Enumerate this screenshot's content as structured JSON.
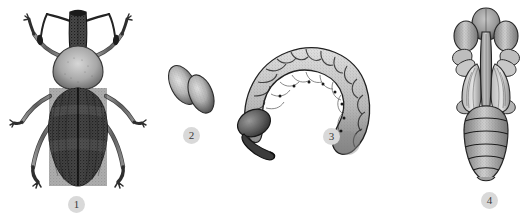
{
  "plate": {
    "title": "Weevil life cycle plate",
    "description": "Scientific stipple-engraving illustration of the four developmental stages of a weevil",
    "width": 527,
    "height": 216,
    "background_color": "#ffffff",
    "style": "stippled pen-and-ink scientific illustration, grayscale"
  },
  "label_style": {
    "circle_fill": "#d9d9d9",
    "text_color": "#3a3a3a",
    "diameter_px": 17
  },
  "figures": [
    {
      "number": "1",
      "name": "adult-weevil",
      "common_name": "Adult weevil",
      "stage": "adult",
      "orientation": "dorsal view",
      "position": {
        "x": 8,
        "y": 4,
        "width": 140,
        "height": 190
      },
      "label_position": {
        "x": 68,
        "y": 196
      },
      "tone": "dark",
      "features": [
        "elongate rostrum (snout)",
        "elbowed clubbed antennae",
        "globular pronotum",
        "dark striate elytra with median suture",
        "three pairs of long legs with clawed tarsi"
      ]
    },
    {
      "number": "2",
      "name": "weevil-eggs",
      "common_name": "Eggs",
      "stage": "egg",
      "orientation": "pair, overlapping obliquely",
      "position": {
        "x": 163,
        "y": 57,
        "width": 60,
        "height": 62
      },
      "label_position": {
        "x": 183,
        "y": 127
      },
      "tone": "medium",
      "count": 2,
      "features": [
        "two elongate-oval eggs",
        "smooth chorion with stippled highlight",
        "darker shaded margins"
      ]
    },
    {
      "number": "3",
      "name": "weevil-larva",
      "common_name": "Larva (grub)",
      "stage": "larva",
      "orientation": "lateral view, C-shaped",
      "position": {
        "x": 230,
        "y": 38,
        "width": 145,
        "height": 125
      },
      "label_position": {
        "x": 323,
        "y": 128
      },
      "tone": "light-medium",
      "features": [
        "legless C-curved body",
        "about twelve swollen dorsal segments",
        "dark head capsule at left",
        "lateral spiracle dots along the flank",
        "wrinkled, finely stippled cuticle"
      ]
    },
    {
      "number": "4",
      "name": "weevil-pupa",
      "common_name": "Pupa",
      "stage": "pupa",
      "orientation": "ventral view",
      "position": {
        "x": 450,
        "y": 6,
        "width": 72,
        "height": 182
      },
      "label_position": {
        "x": 481,
        "y": 192
      },
      "tone": "medium",
      "features": [
        "rostrum folded against the venter",
        "paired wing pads flanking the midline",
        "appendage sheaths for legs and antennae",
        "five-ringed tapering abdomen"
      ]
    }
  ]
}
